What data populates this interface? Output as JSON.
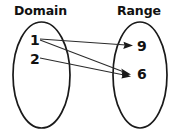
{
  "diagram": {
    "type": "mapping-diagram",
    "sets": [
      {
        "id": "domain",
        "heading": "Domain",
        "elements": [
          {
            "label": "1"
          },
          {
            "label": "2"
          }
        ]
      },
      {
        "id": "range",
        "heading": "Range",
        "elements": [
          {
            "label": "9"
          },
          {
            "label": "6"
          }
        ]
      }
    ],
    "mappings": [
      {
        "from": "1",
        "to": "9"
      },
      {
        "from": "1",
        "to": "6"
      },
      {
        "from": "2",
        "to": "6"
      }
    ],
    "colors": {
      "stroke": "#1a1a1a",
      "arrow": "#2b2b2b",
      "text": "#111111",
      "background": "#ffffff"
    }
  }
}
